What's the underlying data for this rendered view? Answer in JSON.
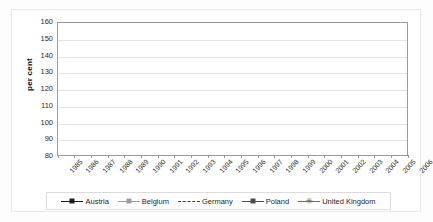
{
  "chart_data": {
    "type": "line",
    "title": "",
    "xlabel": "",
    "ylabel": "per cent",
    "ylim": [
      80,
      160
    ],
    "ytick_step": 10,
    "yticks": [
      160,
      150,
      140,
      130,
      120,
      110,
      100,
      90,
      80
    ],
    "grid": true,
    "legend_position": "bottom",
    "categories": [
      "1985",
      "1986",
      "1987",
      "1988",
      "1989",
      "1990",
      "1991",
      "1992",
      "1993",
      "1994",
      "1995",
      "1996",
      "1997",
      "1998",
      "1999",
      "2000",
      "2001",
      "2002",
      "2003",
      "2004",
      "2005",
      "2006"
    ],
    "series": [
      {
        "name": "Austria",
        "color": "#1c1c1c",
        "marker": "diamond",
        "line_style": "solid",
        "values": [
          100,
          101.5,
          103.5,
          105,
          107.5,
          111,
          115,
          119.5,
          123.5,
          127,
          130.5,
          133,
          135.5,
          136,
          136.5,
          137,
          136.5,
          138.5,
          140,
          136,
          136,
          138
        ]
      },
      {
        "name": "Belgium",
        "color": "#9d9d9d",
        "marker": "square",
        "line_style": "solid",
        "values": [
          null,
          null,
          null,
          null,
          null,
          null,
          null,
          null,
          null,
          null,
          null,
          null,
          null,
          null,
          105,
          107,
          109.5,
          110.5,
          111.5,
          null,
          null,
          null
        ]
      },
      {
        "name": "Germany",
        "color": "#3d3d3d",
        "marker": "none",
        "line_style": "dashed",
        "values": [
          null,
          null,
          null,
          null,
          null,
          null,
          null,
          100,
          100.5,
          101,
          101.5,
          102,
          102,
          100.5,
          103,
          102.5,
          102.5,
          102,
          102,
          101.5,
          101.5,
          101
        ]
      },
      {
        "name": "Poland",
        "color": "#4c4c4c",
        "marker": "square",
        "line_style": "solid",
        "values": [
          null,
          null,
          null,
          null,
          null,
          null,
          null,
          null,
          null,
          null,
          null,
          null,
          null,
          null,
          null,
          null,
          null,
          100,
          100,
          98.5,
          96.5,
          95
        ]
      },
      {
        "name": "United Kingdom",
        "color": "#6a6a6a",
        "marker": "star",
        "line_style": "solid",
        "values": [
          99.5,
          98.5,
          98.5,
          98.5,
          99,
          99.5,
          98,
          105.5,
          111.5,
          116.5,
          121.5,
          126,
          130,
          131,
          132,
          133.5,
          136.5,
          135.5,
          139.5,
          141.5,
          144,
          148
        ]
      }
    ]
  },
  "legend": {
    "items": [
      {
        "label": "Austria"
      },
      {
        "label": "Belgium"
      },
      {
        "label": "Germany"
      },
      {
        "label": "Poland"
      },
      {
        "label": "United Kingdom"
      }
    ]
  },
  "axis": {
    "y_title": "per cent"
  }
}
